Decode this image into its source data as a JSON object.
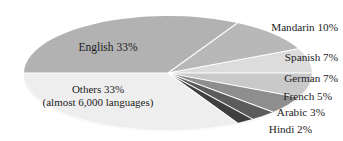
{
  "chart_data": {
    "type": "pie",
    "title": "",
    "subtitle": "",
    "xlabel": "",
    "ylabel": "",
    "legend_position": "callout-labels",
    "grid": false,
    "style": "3d-flattened-ellipse",
    "categories": [
      "English",
      "Mandarin",
      "Spanish",
      "German",
      "French",
      "Arabic",
      "Hindi",
      "Others"
    ],
    "values": [
      33,
      10,
      7,
      7,
      5,
      3,
      2,
      33
    ],
    "labels": [
      "English 33%",
      "Mandarin 10%",
      "Spanish 7%",
      "German 7%",
      "French 5%",
      "Arabic 3%",
      "Hindi 2%",
      "Others 33%"
    ],
    "slice_colors": [
      "#b2b2b2",
      "#b8b8b8",
      "#dcdcdc",
      "#c9c9c9",
      "#8e8e8e",
      "#5c5c5c",
      "#3f3f3f",
      "#eeeeee"
    ],
    "annotations": [
      "(almost 6,000 languages)"
    ]
  },
  "pie": {
    "center_x": 168,
    "center_y": 73,
    "radius_x": 144,
    "radius_y": 57,
    "slices": [
      {
        "name": "english",
        "label": "English 33%",
        "value": 33,
        "color": "#b2b2b2",
        "start": 180,
        "end": 298.8
      },
      {
        "name": "mandarin",
        "label": "Mandarin 10%",
        "value": 10,
        "color": "#b8b8b8",
        "start": 298.8,
        "end": 334.8
      },
      {
        "name": "spanish",
        "label": "Spanish 7%",
        "value": 7,
        "color": "#dcdcdc",
        "start": 334.8,
        "end": 360.0
      },
      {
        "name": "german",
        "label": "German 7%",
        "value": 7,
        "color": "#c9c9c9",
        "start": 0.0,
        "end": 25.2
      },
      {
        "name": "french",
        "label": "French 5%",
        "value": 5,
        "color": "#8e8e8e",
        "start": 25.2,
        "end": 43.2
      },
      {
        "name": "arabic",
        "label": "Arabic 3%",
        "value": 3,
        "color": "#5c5c5c",
        "start": 43.2,
        "end": 54.0
      },
      {
        "name": "hindi",
        "label": "Hindi 2%",
        "value": 2,
        "color": "#3f3f3f",
        "start": 54.0,
        "end": 61.2
      },
      {
        "name": "others",
        "label": "Others 33%",
        "value": 33,
        "color": "#eeeeee",
        "start": 61.2,
        "end": 180.0
      }
    ]
  },
  "labels": {
    "english": {
      "text": "English 33%",
      "x": 108,
      "y": 47
    },
    "others": {
      "text": "Others 33%",
      "x": 98,
      "y": 90
    },
    "others_sub": {
      "text": "(almost 6,000 languages)",
      "x": 98,
      "y": 103
    },
    "mandarin": {
      "text": "Mandarin 10%",
      "x": 338,
      "y": 22
    },
    "spanish": {
      "text": "Spanish 7%",
      "x": 338,
      "y": 52
    },
    "german": {
      "text": "German 7%",
      "x": 338,
      "y": 73
    },
    "french": {
      "text": "French 5%",
      "x": 332,
      "y": 91
    },
    "arabic": {
      "text": "Arabic 3%",
      "x": 325,
      "y": 107
    },
    "hindi": {
      "text": "Hindi 2%",
      "x": 312,
      "y": 124
    }
  },
  "colors": {
    "background": "#ffffff",
    "text": "#1c1c1c",
    "english_slice": "#b2b2b2",
    "others_slice": "#eeeeee",
    "darkest_slice": "#3f3f3f"
  }
}
